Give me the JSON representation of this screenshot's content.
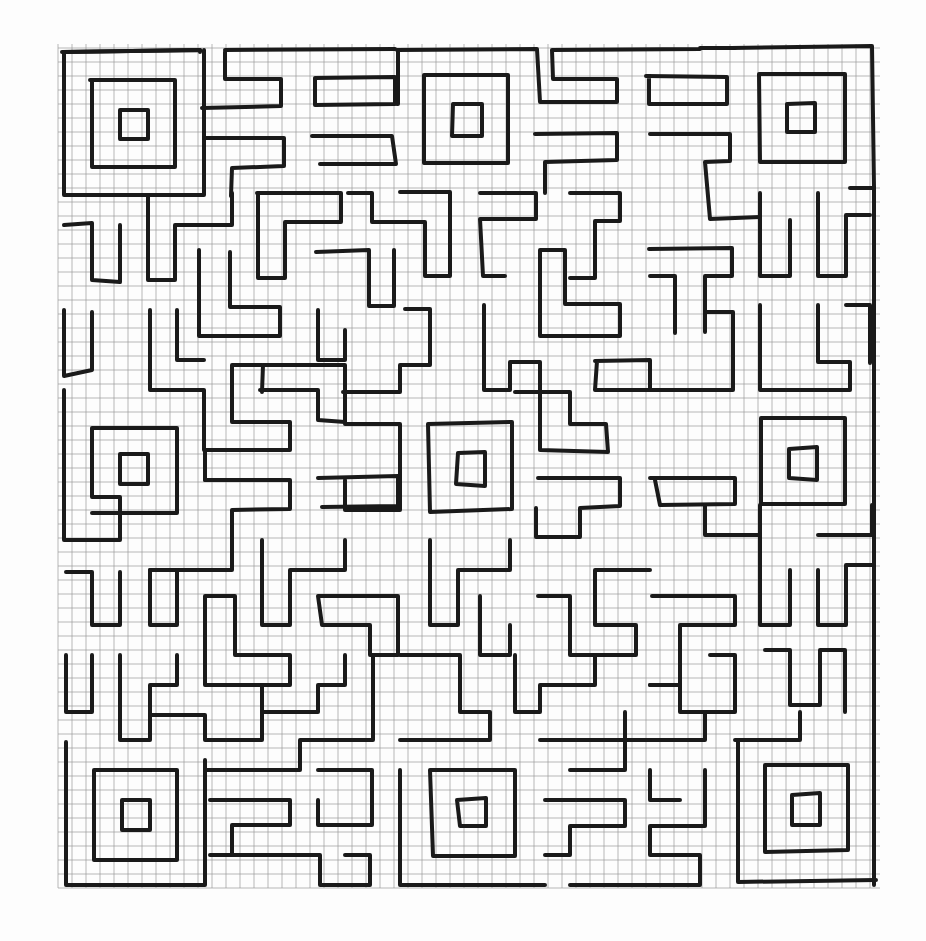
{
  "image": {
    "description": "Hand-drawn square maze on graph paper",
    "background_color": "#fdfdfd",
    "grid_color": "#9a9a9a",
    "ink_color": "#1a1a1a"
  },
  "maze": {
    "bounds": {
      "left": 64,
      "top": 48,
      "right": 872,
      "bottom": 884
    },
    "grid_cell_px": 14,
    "spirals": [
      {
        "name": "top-left",
        "cx": 134,
        "cy": 122
      },
      {
        "name": "top-center",
        "cx": 466,
        "cy": 119
      },
      {
        "name": "top-right",
        "cx": 801,
        "cy": 117
      },
      {
        "name": "middle-left",
        "cx": 134,
        "cy": 466
      },
      {
        "name": "middle-center",
        "cx": 470,
        "cy": 467
      },
      {
        "name": "middle-right",
        "cx": 803,
        "cy": 462
      },
      {
        "name": "bottom-left",
        "cx": 137,
        "cy": 815
      },
      {
        "name": "bottom-center",
        "cx": 472,
        "cy": 811
      },
      {
        "name": "bottom-right",
        "cx": 806,
        "cy": 810
      }
    ]
  }
}
